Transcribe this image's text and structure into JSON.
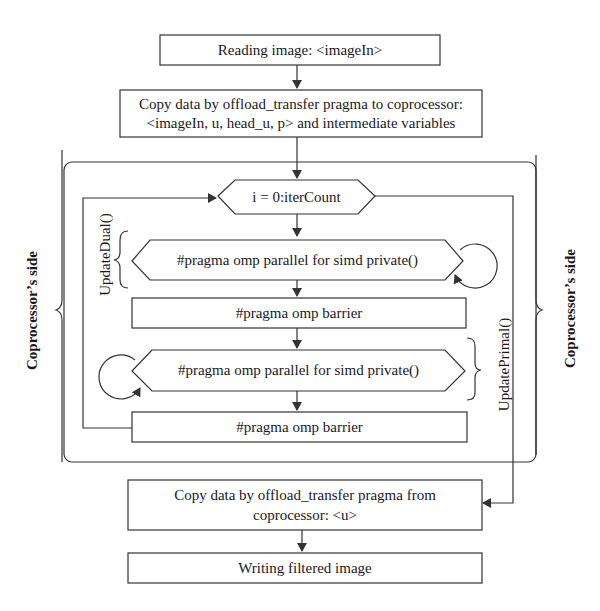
{
  "diagram": {
    "type": "flowchart",
    "nodes": {
      "read_image": "Reading image: <imageIn>",
      "copy_to_line1": "Copy data by offload_transfer pragma to coprocessor:",
      "copy_to_line2": "<imageIn, u, head_u, p> and intermediate variables",
      "loop": "i = 0:iterCount",
      "parallel_dual": "#pragma omp parallel for simd private()",
      "barrier_dual": "#pragma omp barrier",
      "parallel_primal": "#pragma omp parallel for simd private()",
      "barrier_primal": "#pragma omp barrier",
      "copy_from_line1": "Copy data by offload_transfer pragma from",
      "copy_from_line2": "coprocessor: <u>",
      "write_image": "Writing filtered image"
    },
    "labels": {
      "update_dual": "UpdateDual()",
      "update_primal": "UpdatePrimal()",
      "coprocessor_left": "Coprocessor’s side",
      "coprocessor_right": "Coprocessor’s side"
    },
    "edges": [
      [
        "read_image",
        "copy_to"
      ],
      [
        "copy_to",
        "loop"
      ],
      [
        "loop",
        "parallel_dual"
      ],
      [
        "parallel_dual",
        "barrier_dual"
      ],
      [
        "barrier_dual",
        "parallel_primal"
      ],
      [
        "parallel_primal",
        "barrier_primal"
      ],
      [
        "barrier_primal",
        "loop"
      ],
      [
        "loop",
        "copy_from"
      ],
      [
        "copy_from",
        "write_image"
      ]
    ]
  }
}
